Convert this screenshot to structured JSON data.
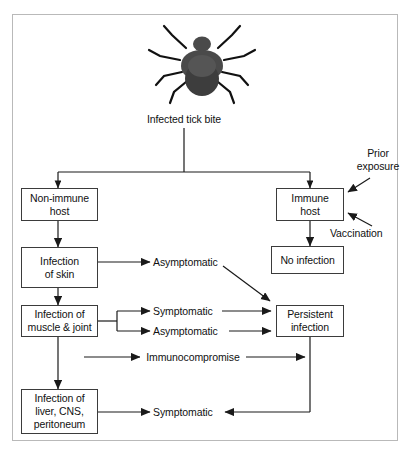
{
  "diagram": {
    "icon": "tick-illustration",
    "colors": {
      "frame_border": "#b9b9b9",
      "box_border": "#3b3b3b",
      "line": "#1a1a1a",
      "text": "#111111",
      "tick_body": "#4a4a4a",
      "tick_legs": "#111111",
      "background": "#ffffff"
    },
    "root_label": "Infected tick bite",
    "nodes": [
      {
        "id": "non-immune-host",
        "label": "Non-immune\nhost"
      },
      {
        "id": "immune-host",
        "label": "Immune\nhost"
      },
      {
        "id": "infection-of-skin",
        "label": "Infection\nof skin"
      },
      {
        "id": "no-infection",
        "label": "No infection"
      },
      {
        "id": "infection-muscle-joint",
        "label": "Infection of\nmuscle & joint"
      },
      {
        "id": "persistent-infection",
        "label": "Persistent\ninfection"
      },
      {
        "id": "infection-liver-cns-peritoneum",
        "label": "Infection of\nliver, CNS,\nperitoneum"
      }
    ],
    "labels": [
      {
        "id": "prior-exposure",
        "text": "Prior\nexposure"
      },
      {
        "id": "vaccination",
        "text": "Vaccination"
      },
      {
        "id": "asymptomatic-skin",
        "text": "Asymptomatic"
      },
      {
        "id": "symptomatic-muscle",
        "text": "Symptomatic"
      },
      {
        "id": "asymptomatic-muscle",
        "text": "Asymptomatic"
      },
      {
        "id": "immunocompromise",
        "text": "Immunocompromise"
      },
      {
        "id": "symptomatic-liver",
        "text": "Symptomatic"
      }
    ]
  }
}
